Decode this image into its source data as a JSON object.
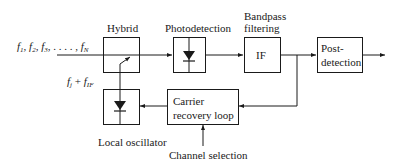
{
  "diagram": {
    "input_signal": {
      "f1": "f",
      "f1_sub": "1",
      "f2": "f",
      "f2_sub": "2",
      "f3": "f",
      "f3_sub": "3",
      "dots": ", . . . . ,",
      "fN": "f",
      "fN_sub": "N"
    },
    "lo_signal": {
      "fj": "f",
      "fj_sub": "j",
      "plus": " + ",
      "fIF": "f",
      "fIF_sub": "IF"
    },
    "blocks": {
      "hybrid": {
        "label": "Hybrid"
      },
      "photodetection": {
        "label": "Photodetection"
      },
      "bandpass": {
        "label_line1": "Bandpass",
        "label_line2": "filtering",
        "inner": "IF"
      },
      "postdetection": {
        "line1": "Post-",
        "line2": "detection"
      },
      "carrier_recovery": {
        "line1": "Carrier",
        "line2": "recovery loop"
      },
      "local_oscillator": {
        "label": "Local oscillator"
      }
    },
    "channel_selection": {
      "label": "Channel selection"
    },
    "colors": {
      "stroke": "#1a1a1a",
      "background": "#ffffff"
    }
  }
}
